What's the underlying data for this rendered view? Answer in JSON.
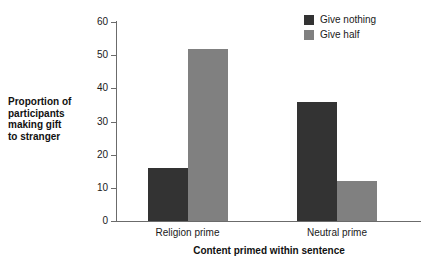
{
  "chart_data": {
    "type": "bar",
    "title": "",
    "xlabel": "Content primed within sentence",
    "ylabel": "Proportion of participants making gift to stranger",
    "ylabel_lines": [
      "Proportion of",
      "participants",
      "making gift",
      "to stranger"
    ],
    "categories": [
      "Religion prime",
      "Neutral prime"
    ],
    "series": [
      {
        "name": "Give nothing",
        "color": "#333333",
        "values": [
          16,
          36
        ]
      },
      {
        "name": "Give half",
        "color": "#808080",
        "values": [
          52,
          12
        ]
      }
    ],
    "ylim": [
      0,
      60
    ],
    "yticks": [
      0,
      10,
      20,
      30,
      40,
      50,
      60
    ],
    "ytick_labels": [
      "0",
      "10",
      "20",
      "30",
      "40",
      "50",
      "60"
    ],
    "grid": false,
    "legend_position": "top-right",
    "axis_color": "#6b6b6b",
    "background": "#ffffff"
  }
}
